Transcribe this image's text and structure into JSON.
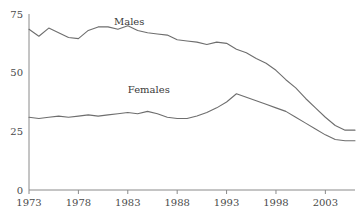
{
  "chart_data": {
    "type": "line",
    "title": "",
    "subtitle": "",
    "xlabel": "",
    "ylabel": "",
    "xlim": [
      1973,
      2006
    ],
    "ylim": [
      0,
      75
    ],
    "grid": false,
    "legend_position": "inline-labels",
    "x_ticks": [
      1973,
      1978,
      1983,
      1988,
      1993,
      1998,
      2003
    ],
    "x_tick_labels": [
      "1973",
      "1978",
      "1983",
      "1988",
      "1993",
      "1998",
      "2003"
    ],
    "y_ticks": [
      0,
      25,
      50,
      75
    ],
    "y_tick_labels": [
      "0",
      "25",
      "50",
      "75"
    ],
    "x": [
      1973,
      1974,
      1975,
      1976,
      1977,
      1978,
      1979,
      1980,
      1981,
      1982,
      1983,
      1984,
      1985,
      1986,
      1987,
      1988,
      1989,
      1990,
      1991,
      1992,
      1993,
      1994,
      1995,
      1996,
      1997,
      1998,
      1999,
      2000,
      2001,
      2002,
      2003,
      2004,
      2005,
      2006
    ],
    "series": [
      {
        "name": "Males",
        "label": "Males",
        "color": "#6e6e6e",
        "label_x": 1981.6,
        "label_y": 70.5,
        "values": [
          68.5,
          65.5,
          69.0,
          67.0,
          65.0,
          64.5,
          68.0,
          69.5,
          69.5,
          68.5,
          70.0,
          68.0,
          67.0,
          66.5,
          66.0,
          64.0,
          63.5,
          63.0,
          62.0,
          63.0,
          62.5,
          60.0,
          58.5,
          56.0,
          54.0,
          51.0,
          47.0,
          43.5,
          39.0,
          35.0,
          31.0,
          27.5,
          25.5,
          25.5
        ]
      },
      {
        "name": "Females",
        "label": "Females",
        "color": "#6e6e6e",
        "label_x": 1983.0,
        "label_y": 41.5,
        "values": [
          31.0,
          30.5,
          31.0,
          31.5,
          31.0,
          31.5,
          32.0,
          31.5,
          32.0,
          32.5,
          33.0,
          32.5,
          33.5,
          32.5,
          31.0,
          30.5,
          30.5,
          31.5,
          33.0,
          35.0,
          37.5,
          41.0,
          39.5,
          38.0,
          36.5,
          35.0,
          33.5,
          31.0,
          28.5,
          26.0,
          23.5,
          21.5,
          21.0,
          21.0
        ]
      }
    ]
  },
  "axis": {
    "y_axis_name": "y-axis",
    "x_axis_name": "x-axis"
  }
}
